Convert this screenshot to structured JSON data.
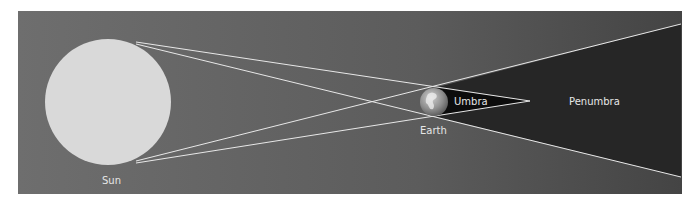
{
  "diagram": {
    "type": "lunar-eclipse-shadow-geometry",
    "labels": {
      "sun": "Sun",
      "earth": "Earth",
      "umbra": "Umbra",
      "penumbra": "Penumbra"
    },
    "colors": {
      "background": "#6b6b6b",
      "sun": "#d9d9d9",
      "penumbra": "#2a2a2a",
      "umbra": "#0e0e0e",
      "lines": "#e8e8e8",
      "earth": "#9a9a9a"
    }
  }
}
